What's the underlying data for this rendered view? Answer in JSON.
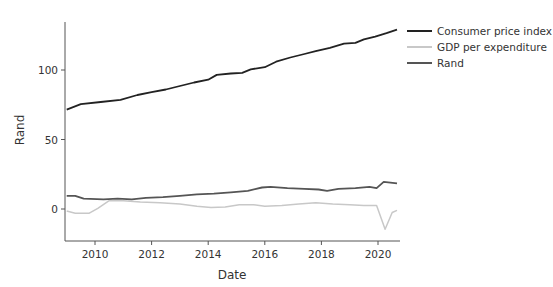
{
  "chart_data": {
    "type": "line",
    "title": "",
    "xlabel": "Date",
    "ylabel": "Rand",
    "xlim": [
      2009.0,
      2020.67
    ],
    "ylim": [
      -23,
      135
    ],
    "grid": false,
    "legend_position": "top-right-outside",
    "x_ticks": [
      2010,
      2012,
      2014,
      2016,
      2018,
      2020
    ],
    "y_ticks": [
      0,
      50,
      100
    ],
    "series": [
      {
        "name": "Consumer price index",
        "color": "#222222",
        "width": 1.8,
        "points": [
          [
            2009.0,
            71.5
          ],
          [
            2009.5,
            75.5
          ],
          [
            2010.2,
            77
          ],
          [
            2010.9,
            78.5
          ],
          [
            2011.5,
            82
          ],
          [
            2012.0,
            84
          ],
          [
            2012.5,
            86
          ],
          [
            2013.0,
            88.5
          ],
          [
            2013.5,
            91
          ],
          [
            2014.0,
            93
          ],
          [
            2014.3,
            96.5
          ],
          [
            2014.8,
            97.5
          ],
          [
            2015.2,
            98
          ],
          [
            2015.5,
            100.5
          ],
          [
            216.0,
            102
          ],
          [
            2016.4,
            106
          ],
          [
            2016.9,
            109
          ],
          [
            2017.4,
            111.5
          ],
          [
            2017.8,
            113.5
          ],
          [
            2018.3,
            116
          ],
          [
            2018.8,
            119
          ],
          [
            2019.2,
            119.5
          ],
          [
            2019.5,
            122
          ],
          [
            2019.9,
            124
          ],
          [
            2020.3,
            126.5
          ],
          [
            2020.67,
            129
          ]
        ]
      },
      {
        "name": "GDP per expenditure",
        "color": "#c8c8c8",
        "width": 1.5,
        "points": [
          [
            2009.0,
            -1.5
          ],
          [
            2009.3,
            -3
          ],
          [
            2009.8,
            -3
          ],
          [
            2010.1,
            0.5
          ],
          [
            2010.5,
            6
          ],
          [
            2011.0,
            6
          ],
          [
            2011.6,
            5
          ],
          [
            2012.3,
            4.5
          ],
          [
            2013.0,
            3.5
          ],
          [
            2013.6,
            2
          ],
          [
            2014.1,
            1
          ],
          [
            2014.6,
            1.5
          ],
          [
            2015.1,
            3
          ],
          [
            2015.6,
            3
          ],
          [
            2016.0,
            2
          ],
          [
            2016.6,
            2.5
          ],
          [
            2017.2,
            3.5
          ],
          [
            2017.8,
            4.5
          ],
          [
            2018.4,
            3.5
          ],
          [
            2019.0,
            3
          ],
          [
            2019.5,
            2.5
          ],
          [
            2019.95,
            2.5
          ],
          [
            2020.25,
            -14.5
          ],
          [
            2020.5,
            -2.5
          ],
          [
            2020.67,
            -1
          ]
        ]
      },
      {
        "name": "Rand",
        "color": "#555555",
        "width": 1.8,
        "points": [
          [
            2009.0,
            9.5
          ],
          [
            2009.3,
            9.5
          ],
          [
            2009.6,
            7.5
          ],
          [
            2010.3,
            7
          ],
          [
            2010.8,
            7.5
          ],
          [
            2011.3,
            7
          ],
          [
            2011.8,
            8
          ],
          [
            2012.4,
            8.5
          ],
          [
            2013.0,
            9.5
          ],
          [
            2013.6,
            10.5
          ],
          [
            2014.2,
            11
          ],
          [
            2014.8,
            12
          ],
          [
            2015.4,
            13
          ],
          [
            2015.9,
            15.5
          ],
          [
            2016.2,
            16
          ],
          [
            2016.8,
            15
          ],
          [
            2017.4,
            14.5
          ],
          [
            2017.9,
            14
          ],
          [
            2018.2,
            13
          ],
          [
            2018.6,
            14.5
          ],
          [
            2019.2,
            15
          ],
          [
            2019.7,
            16
          ],
          [
            2019.95,
            15
          ],
          [
            2020.2,
            19.5
          ],
          [
            2020.67,
            18.5
          ]
        ]
      }
    ]
  },
  "axes": {
    "x_ticks": [
      "2010",
      "2012",
      "2014",
      "2016",
      "2018",
      "2020"
    ],
    "y_ticks": [
      "0",
      "50",
      "100"
    ],
    "xlabel": "Date",
    "ylabel": "Rand"
  },
  "legend": [
    {
      "label": "Consumer price index",
      "color": "#222222"
    },
    {
      "label": "GDP per expenditure",
      "color": "#c8c8c8"
    },
    {
      "label": "Rand",
      "color": "#555555"
    }
  ]
}
